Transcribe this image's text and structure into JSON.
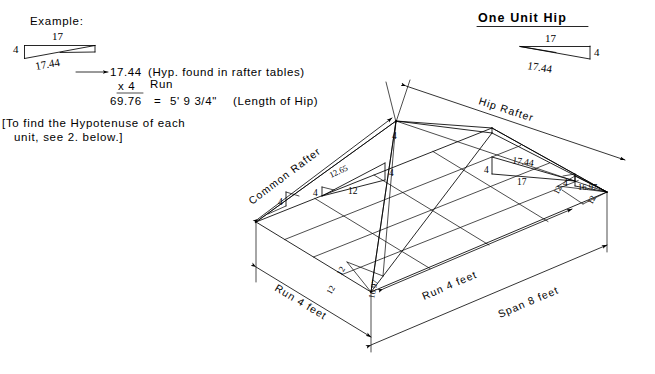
{
  "document": {
    "title": "One Unit Hip — Hip Rafter Layout"
  },
  "example": {
    "heading": "Example:",
    "triangle": {
      "rise_label": "4",
      "run_label": "17",
      "hyp_label": "17.44"
    },
    "calc": {
      "line1_value": "17.44",
      "line1_note": "(Hyp. found in rafter tables)",
      "line2_multiplier": "x 4",
      "line2_note": "Run",
      "line3_result": "69.76",
      "line3_equals": "=",
      "line3_feet_inches": "5' 9 3/4\"",
      "line3_note": "(Length of Hip)"
    },
    "note": {
      "line1": "[To find the Hypotenuse of each",
      "line2": "unit, see 2. below.]"
    }
  },
  "one_unit_hip": {
    "heading": "One Unit Hip",
    "triangle": {
      "run_label": "17",
      "rise_label": "4",
      "hyp_label": "17.44"
    }
  },
  "roof": {
    "leaders": {
      "common_rafter": "Common Rafter",
      "hip_rafter": "Hip Rafter"
    },
    "apex_label": "4",
    "common_triangle": {
      "hyp": "12.65",
      "run": "12",
      "rise_left": "4",
      "rise_right": "4"
    },
    "hip_triangle": {
      "hyp": "17.44",
      "run": "17",
      "rise_left": "4",
      "rise_right": "4"
    },
    "corner_triangle": {
      "hyp": "16.97",
      "side_left": "12",
      "side_right": "12"
    },
    "base_labels": {
      "left_side_12": "12",
      "near_side_12": "12",
      "diagonal_16_97": "16.97",
      "left_eave_4": "4",
      "upper_eave_4": "4"
    },
    "dimensions": {
      "run_left": "Run 4 feet",
      "run_right": "Run 4 feet",
      "span": "Span 8 feet"
    }
  },
  "colors": {
    "ink": "#000000",
    "paper": "#ffffff"
  }
}
